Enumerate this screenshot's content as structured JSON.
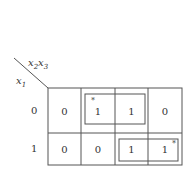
{
  "kmap": {
    "row_var": "x",
    "row_var_sub": "1",
    "col_var_a": "x",
    "col_var_a_sub": "2",
    "col_var_b": "x",
    "col_var_b_sub": "3",
    "row_labels": [
      "0",
      "1"
    ],
    "cells": [
      [
        "0",
        "1",
        "1",
        "0"
      ],
      [
        "0",
        "0",
        "1",
        "1"
      ]
    ],
    "essential_marks": [
      {
        "row": 0,
        "col": 1,
        "mark": "*"
      },
      {
        "row": 1,
        "col": 3,
        "mark": "*"
      }
    ],
    "groups": [
      {
        "name": "group-row0-cols12",
        "row": 0,
        "cols": [
          1,
          2
        ]
      },
      {
        "name": "group-row1-cols23",
        "row": 1,
        "cols": [
          2,
          3
        ]
      }
    ]
  }
}
